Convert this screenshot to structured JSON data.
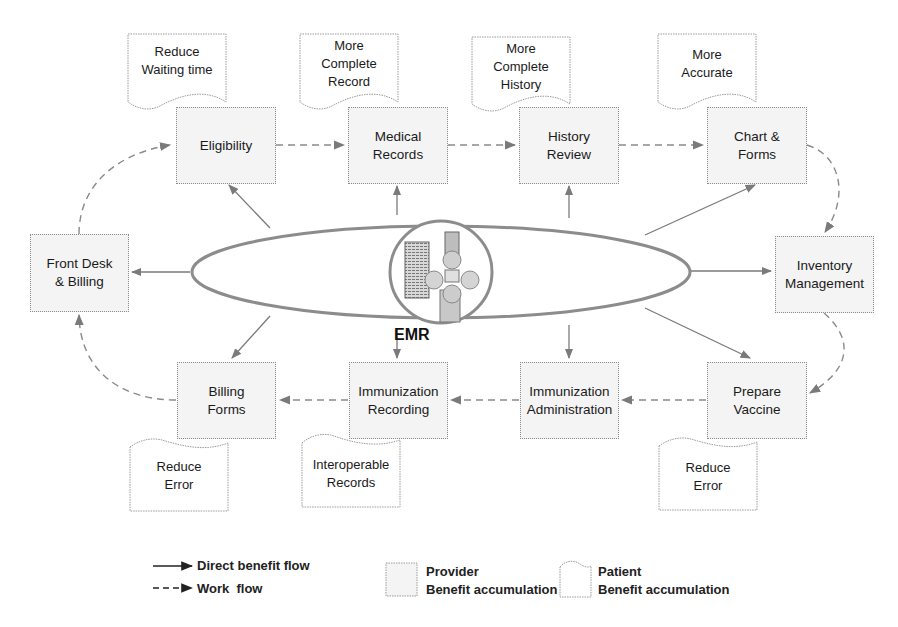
{
  "diagram": {
    "center": {
      "label": "EMR",
      "icon": "server-network-icon"
    },
    "provider_boxes": [
      {
        "id": "eligibility",
        "label": "Eligibility"
      },
      {
        "id": "medical-records",
        "label": "Medical\nRecords"
      },
      {
        "id": "history-review",
        "label": "History\nReview"
      },
      {
        "id": "chart-forms",
        "label": "Chart &\nForms"
      },
      {
        "id": "front-desk-billing",
        "label": "Front Desk\n& Billing"
      },
      {
        "id": "inventory-management",
        "label": "Inventory\nManagement"
      },
      {
        "id": "billing-forms",
        "label": "Billing\nForms"
      },
      {
        "id": "immunization-recording",
        "label": "Immunization\nRecording"
      },
      {
        "id": "immunization-administration",
        "label": "Immunization\nAdministration"
      },
      {
        "id": "prepare-vaccine",
        "label": "Prepare\nVaccine"
      }
    ],
    "patient_notes": [
      {
        "id": "note-eligibility",
        "attached_to": "eligibility",
        "label": "Reduce\nWaiting time"
      },
      {
        "id": "note-medical-records",
        "attached_to": "medical-records",
        "label": "More\nComplete\nRecord"
      },
      {
        "id": "note-history-review",
        "attached_to": "history-review",
        "label": "More\nComplete\nHistory"
      },
      {
        "id": "note-chart-forms",
        "attached_to": "chart-forms",
        "label": "More\nAccurate"
      },
      {
        "id": "note-billing-forms",
        "attached_to": "billing-forms",
        "label": "Reduce\nError"
      },
      {
        "id": "note-immunization-recording",
        "attached_to": "immunization-recording",
        "label": "Interoperable\nRecords"
      },
      {
        "id": "note-prepare-vaccine",
        "attached_to": "prepare-vaccine",
        "label": "Reduce\nError"
      }
    ],
    "work_flow": [
      [
        "front-desk-billing",
        "eligibility"
      ],
      [
        "eligibility",
        "medical-records"
      ],
      [
        "medical-records",
        "history-review"
      ],
      [
        "history-review",
        "chart-forms"
      ],
      [
        "chart-forms",
        "inventory-management"
      ],
      [
        "inventory-management",
        "prepare-vaccine"
      ],
      [
        "prepare-vaccine",
        "immunization-administration"
      ],
      [
        "immunization-administration",
        "immunization-recording"
      ],
      [
        "immunization-recording",
        "billing-forms"
      ],
      [
        "billing-forms",
        "front-desk-billing"
      ]
    ],
    "direct_benefit_flow_from": "EMR",
    "direct_benefit_flow_to": [
      "eligibility",
      "medical-records",
      "history-review",
      "chart-forms",
      "front-desk-billing",
      "inventory-management",
      "billing-forms",
      "immunization-recording",
      "immunization-administration",
      "prepare-vaccine"
    ]
  },
  "legend": {
    "direct_benefit_flow": "Direct benefit flow",
    "work_flow": "Work  flow",
    "provider_title": "Provider",
    "provider_sub": "Benefit accumulation",
    "patient_title": "Patient",
    "patient_sub": "Benefit accumulation"
  },
  "colors": {
    "box_fill": "#f4f4f4",
    "box_border": "#8a8a8a",
    "arrow": "#7a7a7a",
    "ellipse_stroke": "#888888"
  }
}
